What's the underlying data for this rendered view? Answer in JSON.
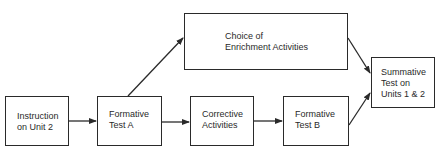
{
  "diagram": {
    "type": "flowchart",
    "nodes": [
      {
        "id": "instruction",
        "label": "Instruction\non Unit 2"
      },
      {
        "id": "formative_a",
        "label": "Formative\nTest A"
      },
      {
        "id": "enrichment",
        "label": "Choice  of\nEnrichment Activities"
      },
      {
        "id": "corrective",
        "label": "Corrective\nActivities"
      },
      {
        "id": "formative_b",
        "label": "Formative\nTest B"
      },
      {
        "id": "summative",
        "label": "Summative\nTest on\nUnits 1 & 2"
      }
    ],
    "edges": [
      {
        "from": "instruction",
        "to": "formative_a"
      },
      {
        "from": "formative_a",
        "to": "enrichment"
      },
      {
        "from": "formative_a",
        "to": "corrective"
      },
      {
        "from": "corrective",
        "to": "formative_b"
      },
      {
        "from": "enrichment",
        "to": "summative"
      },
      {
        "from": "formative_b",
        "to": "summative"
      }
    ],
    "colors": {
      "stroke": "#2a2a2a",
      "background": "#ffffff"
    }
  }
}
